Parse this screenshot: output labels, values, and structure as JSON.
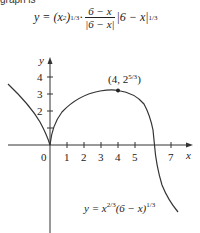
{
  "header": {
    "label": "graph is"
  },
  "formula_top": "y = (x²)^1/3 · (6 − x)/|6 − x| |6 − x|^1/3",
  "formula_parts": {
    "lhs": "y = (x",
    "sq": "2",
    "p1": ")",
    "e1": "1/3",
    "dot": " · ",
    "num": "6 − x",
    "den": "|6 − x|",
    "abs": "|6 − x|",
    "e2": "1/3"
  },
  "graph": {
    "x_axis_label": "x",
    "y_axis_label": "y",
    "origin_label": "0",
    "x_ticks": [
      "1",
      "2",
      "3",
      "4",
      "5",
      "7"
    ],
    "y_ticks": [
      "2",
      "3",
      "4"
    ],
    "point_label": "(4, 2",
    "point_exp": "5/3",
    "point_close": ")",
    "curve_label": "y = x",
    "curve_exp1": "2/3",
    "curve_mid": "(6 − x)",
    "curve_exp2": "1/3",
    "curve_color": "#333333"
  }
}
